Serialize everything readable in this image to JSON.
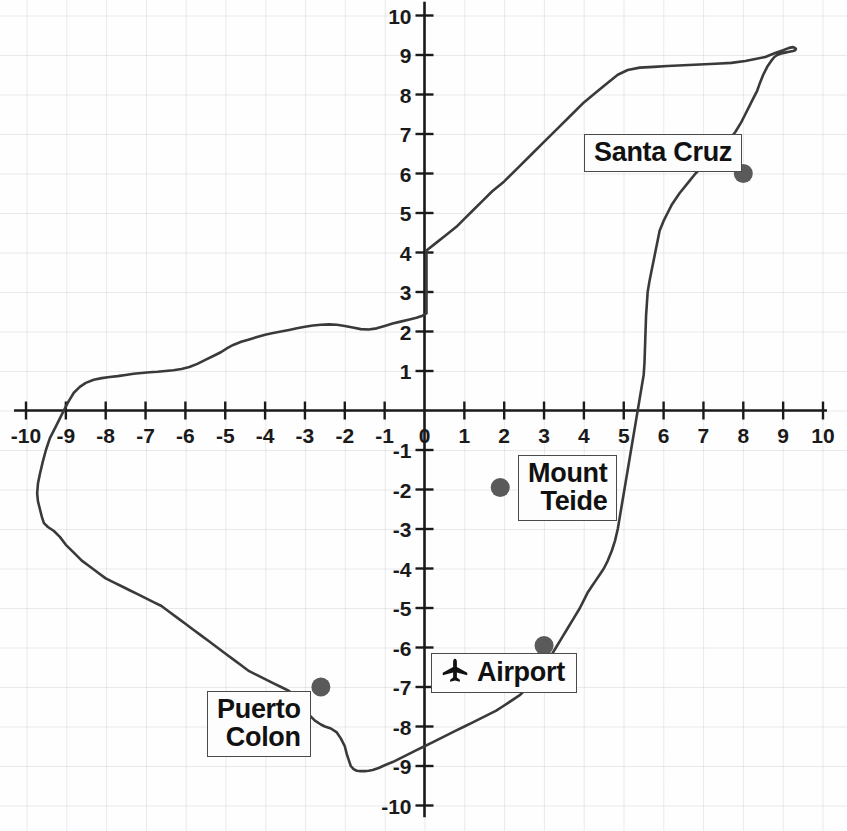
{
  "figure": {
    "kind": "annotated-coastline-map",
    "background_color": "#fefefe",
    "grid_color": "#d3d8e2",
    "axis_color": "#1a1a1a",
    "coastline_color": "#3a3a3a",
    "marker_dot_color": "#5a5a5a",
    "label_box_border_color": "#4a4a4a",
    "label_box_fill_color": "#fdfdfd"
  },
  "chart_data": {
    "type": "scatter",
    "title": "",
    "xlabel": "",
    "ylabel": "",
    "xlim": [
      -10,
      10
    ],
    "ylim": [
      -10,
      10
    ],
    "grid": true,
    "legend": "none",
    "x_ticks": [
      -10,
      -9,
      -8,
      -7,
      -6,
      -5,
      -4,
      -3,
      -2,
      -1,
      0,
      1,
      2,
      3,
      4,
      5,
      6,
      7,
      8,
      9,
      10
    ],
    "y_ticks": [
      -10,
      -9,
      -8,
      -7,
      -6,
      -5,
      -4,
      -3,
      -2,
      -1,
      1,
      2,
      3,
      4,
      5,
      6,
      7,
      8,
      9,
      10
    ],
    "x_tick_labels": [
      "-10",
      "-9",
      "-8",
      "-7",
      "-6",
      "-5",
      "-4",
      "-3",
      "-2",
      "-1",
      "0",
      "1",
      "2",
      "3",
      "4",
      "5",
      "6",
      "7",
      "8",
      "9",
      "10"
    ],
    "y_tick_labels": [
      "-10",
      "-9",
      "-8",
      "-7",
      "-6",
      "-5",
      "-4",
      "-3",
      "-2",
      "-1",
      "1",
      "2",
      "3",
      "4",
      "5",
      "6",
      "7",
      "8",
      "9",
      "10"
    ],
    "points": [
      {
        "name": "Santa Cruz",
        "x": 8.0,
        "y": 6.0
      },
      {
        "name": "Mount Teide",
        "x": 1.9,
        "y": -1.95
      },
      {
        "name": "Airport",
        "x": 3.0,
        "y": -5.95
      },
      {
        "name": "Puerto Colon",
        "x": -2.6,
        "y": -7.0
      }
    ],
    "coastline": {
      "name": "island outline",
      "closed": true,
      "x": [
        0.05,
        0.3,
        0.55,
        0.8,
        1.0,
        1.2,
        1.45,
        1.7,
        2.0,
        2.35,
        2.7,
        3.05,
        3.4,
        3.7,
        4.0,
        4.3,
        4.6,
        4.85,
        5.1,
        5.4,
        5.75,
        6.1,
        6.5,
        6.9,
        7.3,
        7.7,
        8.05,
        8.3,
        8.55,
        8.8,
        9.0,
        9.15,
        9.25,
        9.3,
        9.32,
        9.3,
        9.25,
        9.15,
        9.05,
        8.95,
        8.85,
        8.78,
        8.7,
        8.6,
        8.5,
        8.42,
        8.35,
        8.25,
        8.15,
        8.05,
        7.95,
        7.8,
        7.6,
        7.4,
        7.2,
        7.0,
        6.8,
        6.6,
        6.4,
        6.2,
        6.1,
        6.0,
        5.9,
        5.85,
        5.8,
        5.75,
        5.7,
        5.65,
        5.6,
        5.58,
        5.56,
        5.55,
        5.54,
        5.53,
        5.52,
        5.5,
        5.45,
        5.4,
        5.35,
        5.3,
        5.25,
        5.2,
        5.15,
        5.1,
        5.05,
        5.0,
        4.95,
        4.9,
        4.85,
        4.78,
        4.7,
        4.6,
        4.5,
        4.4,
        4.3,
        4.2,
        4.1,
        4.0,
        3.9,
        3.75,
        3.6,
        3.45,
        3.3,
        3.15,
        3.0,
        2.85,
        2.7,
        2.55,
        2.4,
        2.25,
        2.1,
        1.95,
        1.8,
        1.6,
        1.4,
        1.2,
        1.0,
        0.8,
        0.6,
        0.4,
        0.2,
        0.0,
        -0.2,
        -0.4,
        -0.6,
        -0.8,
        -1.0,
        -1.15,
        -1.3,
        -1.4,
        -1.5,
        -1.6,
        -1.7,
        -1.78,
        -1.85,
        -1.9,
        -1.95,
        -2.0,
        -2.1,
        -2.2,
        -2.35,
        -2.5,
        -2.6,
        -2.75,
        -2.9,
        -3.05,
        -3.2,
        -3.4,
        -3.6,
        -3.8,
        -4.0,
        -4.2,
        -4.4,
        -4.6,
        -4.8,
        -5.0,
        -5.2,
        -5.4,
        -5.6,
        -5.8,
        -6.0,
        -6.2,
        -6.4,
        -6.6,
        -6.8,
        -7.0,
        -7.2,
        -7.4,
        -7.6,
        -7.8,
        -8.0,
        -8.2,
        -8.4,
        -8.6,
        -8.8,
        -9.0,
        -9.15,
        -9.3,
        -9.45,
        -9.55,
        -9.6,
        -9.65,
        -9.7,
        -9.72,
        -9.7,
        -9.65,
        -9.58,
        -9.5,
        -9.4,
        -9.25,
        -9.1,
        -8.95,
        -8.8,
        -8.65,
        -8.5,
        -8.3,
        -8.1,
        -7.9,
        -7.7,
        -7.5,
        -7.3,
        -7.1,
        -6.9,
        -6.7,
        -6.5,
        -6.3,
        -6.1,
        -5.9,
        -5.7,
        -5.5,
        -5.3,
        -5.1,
        -4.95,
        -4.8,
        -4.6,
        -4.4,
        -4.2,
        -4.0,
        -3.8,
        -3.6,
        -3.4,
        -3.2,
        -3.0,
        -2.8,
        -2.6,
        -2.4,
        -2.2,
        -2.0,
        -1.8,
        -1.6,
        -1.4,
        -1.2,
        -1.0,
        -0.8,
        -0.6,
        -0.4,
        -0.2,
        -0.05,
        0.05
      ],
      "y": [
        4.05,
        4.25,
        4.45,
        4.65,
        4.85,
        5.05,
        5.3,
        5.55,
        5.8,
        6.15,
        6.5,
        6.85,
        7.2,
        7.5,
        7.8,
        8.05,
        8.3,
        8.5,
        8.62,
        8.68,
        8.7,
        8.72,
        8.74,
        8.76,
        8.78,
        8.8,
        8.85,
        8.9,
        8.95,
        9.05,
        9.12,
        9.18,
        9.2,
        9.18,
        9.15,
        9.12,
        9.1,
        9.08,
        9.06,
        9.04,
        9.0,
        8.95,
        8.85,
        8.7,
        8.5,
        8.3,
        8.1,
        7.9,
        7.7,
        7.5,
        7.3,
        7.05,
        6.8,
        6.6,
        6.4,
        6.2,
        6.0,
        5.75,
        5.5,
        5.2,
        5.0,
        4.8,
        4.55,
        4.3,
        4.05,
        3.8,
        3.55,
        3.3,
        3.0,
        2.7,
        2.4,
        2.1,
        1.8,
        1.5,
        1.2,
        0.9,
        0.6,
        0.3,
        0.0,
        -0.3,
        -0.6,
        -0.9,
        -1.2,
        -1.5,
        -1.8,
        -2.1,
        -2.4,
        -2.7,
        -3.0,
        -3.3,
        -3.55,
        -3.8,
        -4.0,
        -4.15,
        -4.3,
        -4.45,
        -4.6,
        -4.8,
        -5.0,
        -5.25,
        -5.5,
        -5.75,
        -6.0,
        -6.25,
        -6.5,
        -6.7,
        -6.9,
        -7.05,
        -7.2,
        -7.3,
        -7.4,
        -7.5,
        -7.6,
        -7.7,
        -7.8,
        -7.9,
        -8.0,
        -8.1,
        -8.2,
        -8.3,
        -8.4,
        -8.5,
        -8.6,
        -8.7,
        -8.8,
        -8.9,
        -8.98,
        -9.05,
        -9.1,
        -9.12,
        -9.13,
        -9.13,
        -9.12,
        -9.08,
        -9.0,
        -8.85,
        -8.7,
        -8.5,
        -8.3,
        -8.15,
        -8.05,
        -8.0,
        -7.95,
        -7.85,
        -7.7,
        -7.5,
        -7.3,
        -7.1,
        -7.0,
        -6.9,
        -6.8,
        -6.7,
        -6.6,
        -6.45,
        -6.3,
        -6.15,
        -6.0,
        -5.85,
        -5.7,
        -5.55,
        -5.4,
        -5.25,
        -5.1,
        -4.95,
        -4.85,
        -4.75,
        -4.65,
        -4.55,
        -4.45,
        -4.35,
        -4.25,
        -4.1,
        -3.95,
        -3.8,
        -3.6,
        -3.4,
        -3.2,
        -3.05,
        -2.95,
        -2.85,
        -2.7,
        -2.5,
        -2.3,
        -2.1,
        -1.85,
        -1.6,
        -1.3,
        -1.0,
        -0.7,
        -0.4,
        -0.1,
        0.2,
        0.45,
        0.6,
        0.7,
        0.78,
        0.82,
        0.85,
        0.87,
        0.9,
        0.93,
        0.95,
        0.97,
        0.98,
        1.0,
        1.02,
        1.05,
        1.1,
        1.18,
        1.28,
        1.38,
        1.48,
        1.58,
        1.66,
        1.74,
        1.8,
        1.86,
        1.92,
        1.96,
        2.0,
        2.04,
        2.08,
        2.12,
        2.15,
        2.17,
        2.18,
        2.17,
        2.14,
        2.1,
        2.06,
        2.05,
        2.08,
        2.14,
        2.2,
        2.25,
        2.3,
        2.35,
        2.4,
        2.46,
        2.52,
        2.6,
        2.7,
        2.8,
        2.9,
        3.0,
        3.1,
        3.2,
        3.35,
        3.55,
        3.75,
        3.95,
        4.02,
        4.05
      ]
    }
  },
  "axis_labels": {
    "x": [
      "-10",
      "-9",
      "-8",
      "-7",
      "-6",
      "-5",
      "-4",
      "-3",
      "-2",
      "-1",
      "0",
      "1",
      "2",
      "3",
      "4",
      "5",
      "6",
      "7",
      "8",
      "9",
      "10"
    ],
    "y": [
      "10",
      "9",
      "8",
      "7",
      "6",
      "5",
      "4",
      "3",
      "2",
      "1",
      "-1",
      "-2",
      "-3",
      "-4",
      "-5",
      "-6",
      "-7",
      "-8",
      "-9",
      "-10"
    ]
  },
  "markers": [
    {
      "id": "santa-cruz",
      "lines": [
        "Santa Cruz"
      ],
      "icon": null,
      "dot": {
        "x": 8.0,
        "y": 6.0
      },
      "box_left_px": 584,
      "box_top_px": 134
    },
    {
      "id": "mount-teide",
      "lines": [
        "Mount",
        "Teide"
      ],
      "icon": null,
      "dot": {
        "x": 1.9,
        "y": -1.95
      },
      "box_left_px": 518,
      "box_top_px": 455
    },
    {
      "id": "airport",
      "lines": [
        "Airport"
      ],
      "icon": "airplane-icon",
      "dot": {
        "x": 3.0,
        "y": -5.95
      },
      "box_left_px": 431,
      "box_top_px": 653
    },
    {
      "id": "puerto-colon",
      "lines": [
        "Puerto",
        "Colon"
      ],
      "icon": null,
      "dot": {
        "x": -2.6,
        "y": -7.0
      },
      "box_left_px": 207,
      "box_top_px": 691
    }
  ]
}
